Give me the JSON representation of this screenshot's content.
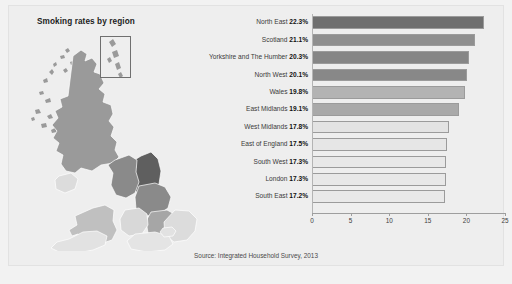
{
  "panel": {
    "title": "Smoking rates by region",
    "source": "Source: Integrated Household Survey, 2013"
  },
  "map": {
    "name": "uk-choropleth-map",
    "inset_label": "scotland-islands-inset"
  },
  "chart_data": {
    "type": "bar",
    "orientation": "horizontal",
    "title": "Smoking rates by region",
    "xlabel": "",
    "ylabel": "",
    "xlim": [
      0,
      25
    ],
    "grid": false,
    "legend": "none",
    "source": "Source: Integrated Household Survey, 2013",
    "xticks": [
      "0",
      "5",
      "10",
      "15",
      "20",
      "25"
    ],
    "xtick_values": [
      0,
      5,
      10,
      15,
      20,
      25
    ],
    "categories": [
      "North East",
      "Scotland",
      "Yorkshire and The Humber",
      "North West",
      "Wales",
      "East Midlands",
      "West Midlands",
      "East of England",
      "South West",
      "London",
      "South East"
    ],
    "values": [
      22.3,
      21.1,
      20.3,
      20.1,
      19.8,
      19.1,
      17.8,
      17.5,
      17.3,
      17.3,
      17.2
    ],
    "value_labels": [
      "22.3%",
      "21.1%",
      "20.3%",
      "20.1%",
      "19.8%",
      "19.1%",
      "17.8%",
      "17.5%",
      "17.3%",
      "17.3%",
      "17.2%"
    ],
    "colors": [
      "#6f6f6f",
      "#8f8f8f",
      "#868686",
      "#888888",
      "#b3b3b3",
      "#a9a9a9",
      "#e3e3e3",
      "#e6e6e6",
      "#e8e8e8",
      "#e8e8e8",
      "#e9e9e9"
    ],
    "rows": [
      {
        "label": "North East",
        "value": 22.3,
        "value_label": "22.3%",
        "color": "#6f6f6f"
      },
      {
        "label": "Scotland",
        "value": 21.1,
        "value_label": "21.1%",
        "color": "#8f8f8f"
      },
      {
        "label": "Yorkshire and The Humber",
        "value": 20.3,
        "value_label": "20.3%",
        "color": "#868686"
      },
      {
        "label": "North West",
        "value": 20.1,
        "value_label": "20.1%",
        "color": "#888888"
      },
      {
        "label": "Wales",
        "value": 19.8,
        "value_label": "19.8%",
        "color": "#b3b3b3"
      },
      {
        "label": "East Midlands",
        "value": 19.1,
        "value_label": "19.1%",
        "color": "#a9a9a9"
      },
      {
        "label": "West Midlands",
        "value": 17.8,
        "value_label": "17.8%",
        "color": "#e3e3e3"
      },
      {
        "label": "East of England",
        "value": 17.5,
        "value_label": "17.5%",
        "color": "#e6e6e6"
      },
      {
        "label": "South West",
        "value": 17.3,
        "value_label": "17.3%",
        "color": "#e8e8e8"
      },
      {
        "label": "London",
        "value": 17.3,
        "value_label": "17.3%",
        "color": "#e8e8e8"
      },
      {
        "label": "South East",
        "value": 17.2,
        "value_label": "17.2%",
        "color": "#e9e9e9"
      }
    ]
  }
}
